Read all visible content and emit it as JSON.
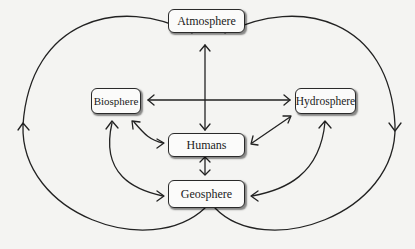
{
  "diagram": {
    "type": "earth-system-interactions",
    "nodes": {
      "atmosphere": "Atmosphere",
      "biosphere": "Biosphere",
      "hydrosphere": "Hydrosphere",
      "humans": "Humans",
      "geosphere": "Geosphere"
    },
    "edges": [
      {
        "from": "Atmosphere",
        "to": "Humans",
        "direction": "bidirectional"
      },
      {
        "from": "Biosphere",
        "to": "Hydrosphere",
        "direction": "bidirectional"
      },
      {
        "from": "Biosphere",
        "to": "Humans",
        "direction": "bidirectional"
      },
      {
        "from": "Hydrosphere",
        "to": "Humans",
        "direction": "bidirectional"
      },
      {
        "from": "Humans",
        "to": "Geosphere",
        "direction": "bidirectional"
      },
      {
        "from": "Biosphere",
        "to": "Geosphere",
        "direction": "bidirectional"
      },
      {
        "from": "Hydrosphere",
        "to": "Geosphere",
        "direction": "bidirectional"
      },
      {
        "from": "Geosphere",
        "to": "Atmosphere",
        "via": "left-outer-loop",
        "direction": "upward"
      },
      {
        "from": "Atmosphere",
        "to": "Geosphere",
        "via": "right-outer-loop",
        "direction": "downward"
      }
    ],
    "colors": {
      "line": "#222222",
      "box_fill": "#fbfbfa",
      "background": "#f4f4f2"
    }
  }
}
